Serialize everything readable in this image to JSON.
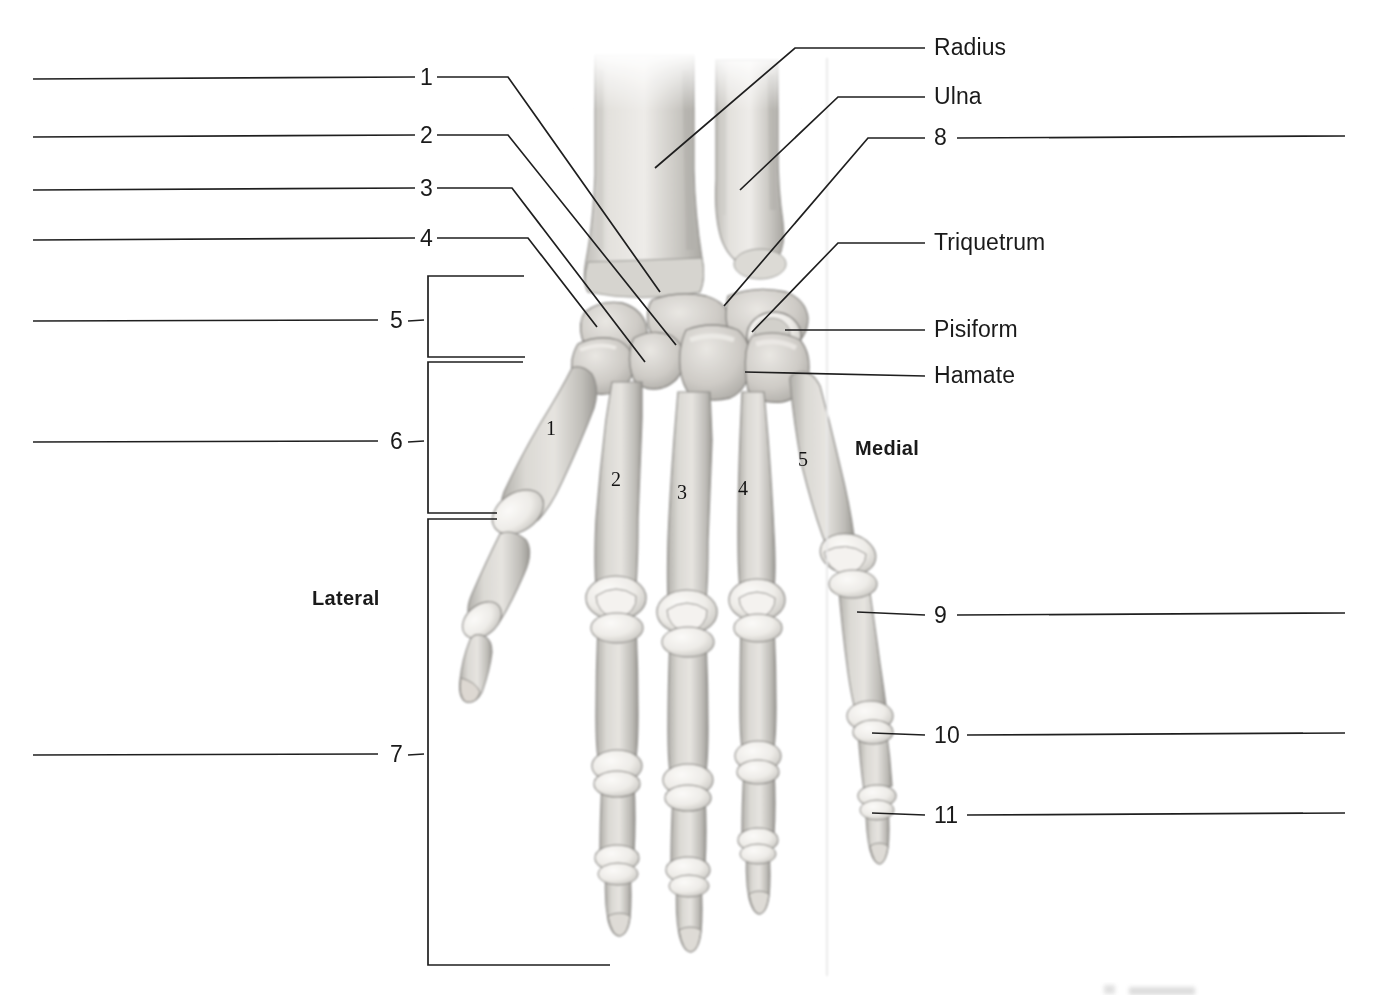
{
  "figure": {
    "view": "Posterior (dorsal) view of right hand skeleton",
    "orientation_labels": {
      "lateral": "Lateral",
      "medial": "Medial"
    }
  },
  "left_callouts": [
    {
      "id": "1",
      "number": "1",
      "style": "line"
    },
    {
      "id": "2",
      "number": "2",
      "style": "line"
    },
    {
      "id": "3",
      "number": "3",
      "style": "line"
    },
    {
      "id": "4",
      "number": "4",
      "style": "line"
    },
    {
      "id": "5",
      "number": "5",
      "style": "bracket"
    },
    {
      "id": "6",
      "number": "6",
      "style": "bracket"
    },
    {
      "id": "7",
      "number": "7",
      "style": "bracket"
    }
  ],
  "right_callouts": [
    {
      "id": "radius",
      "number": "",
      "label": "Radius",
      "style": "named"
    },
    {
      "id": "ulna",
      "number": "",
      "label": "Ulna",
      "style": "named"
    },
    {
      "id": "8",
      "number": "8",
      "label": "",
      "style": "blank"
    },
    {
      "id": "triquetrum",
      "number": "",
      "label": "Triquetrum",
      "style": "named"
    },
    {
      "id": "pisiform",
      "number": "",
      "label": "Pisiform",
      "style": "named"
    },
    {
      "id": "hamate",
      "number": "",
      "label": "Hamate",
      "style": "named"
    },
    {
      "id": "9",
      "number": "9",
      "label": "",
      "style": "blank"
    },
    {
      "id": "10",
      "number": "10",
      "label": "",
      "style": "blank"
    },
    {
      "id": "11",
      "number": "11",
      "label": "",
      "style": "blank"
    }
  ],
  "metacarpal_numbers": [
    {
      "number": "1",
      "x": 551,
      "y": 429
    },
    {
      "number": "2",
      "x": 616,
      "y": 480
    },
    {
      "number": "3",
      "x": 682,
      "y": 493
    },
    {
      "number": "4",
      "x": 743,
      "y": 489
    },
    {
      "number": "5",
      "x": 803,
      "y": 460
    }
  ],
  "colors": {
    "line": "#1f1f1f",
    "text": "#1a1a1a",
    "background": "#ffffff",
    "bone_light": "#f2f1ee",
    "bone_mid": "#c9c7c2",
    "bone_shadow": "#9b9995",
    "bone_outline": "#8d8b87"
  }
}
